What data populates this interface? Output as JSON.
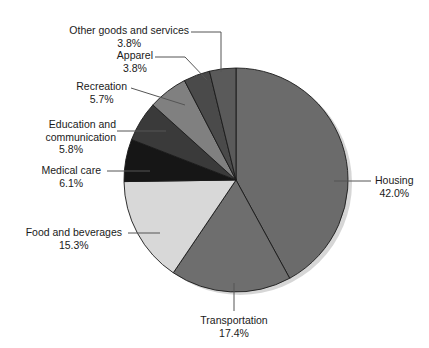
{
  "chart_data": {
    "type": "pie",
    "title": "",
    "subtitle": "",
    "xlabel": "",
    "ylabel": "",
    "legend_position": "none",
    "grid": false,
    "labels_outside": true,
    "start_angle_deg": 0,
    "direction": "clockwise",
    "units": "percent",
    "categories": [
      "Housing",
      "Transportation",
      "Food and beverages",
      "Medical care",
      "Education and communication",
      "Recreation",
      "Apparel",
      "Other goods and services"
    ],
    "values": [
      42.0,
      17.4,
      15.3,
      6.1,
      5.8,
      5.7,
      3.8,
      3.8
    ],
    "slices": [
      {
        "name": "Housing",
        "value": 42.0,
        "label": "Housing",
        "percent_text": "42.0%",
        "color": "#6b6b6b"
      },
      {
        "name": "Transportation",
        "value": 17.4,
        "label": "Transportation",
        "percent_text": "17.4%",
        "color": "#6e6e6e"
      },
      {
        "name": "Food and beverages",
        "value": 15.3,
        "label": "Food and beverages",
        "percent_text": "15.3%",
        "color": "#d8d8d8"
      },
      {
        "name": "Medical care",
        "value": 6.1,
        "label": "Medical care",
        "percent_text": "6.1%",
        "color": "#161616"
      },
      {
        "name": "Education and communication",
        "value": 5.8,
        "label": "Education and communication",
        "label_line1": "Education and",
        "label_line2": "communication",
        "percent_text": "5.8%",
        "color": "#3a3a3a"
      },
      {
        "name": "Recreation",
        "value": 5.7,
        "label": "Recreation",
        "percent_text": "5.7%",
        "color": "#808080"
      },
      {
        "name": "Apparel",
        "value": 3.8,
        "label": "Apparel",
        "percent_text": "3.8%",
        "color": "#4a4a4a"
      },
      {
        "name": "Other goods and services",
        "value": 3.8,
        "label": "Other goods and services",
        "percent_text": "3.8%",
        "color": "#5a5a5a"
      }
    ],
    "style": {
      "background": "#ffffff",
      "slice_outline": "#1a1a1a",
      "leader_line": "#555555",
      "text_color": "#1a1a1a",
      "shadow": "#cfcfcf"
    },
    "geometry": {
      "center_x": 236,
      "center_y": 180,
      "radius": 112
    }
  }
}
